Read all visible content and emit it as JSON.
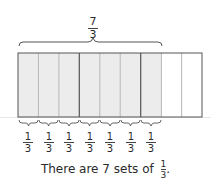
{
  "diagram": {
    "total_label": {
      "numerator": "7",
      "denominator": "3"
    },
    "bar": {
      "cell_count": 9,
      "shaded_cells": 7,
      "group_size": 3,
      "shaded_color": "#ececec",
      "unshaded_color": "#ffffff",
      "border_color": "#555555",
      "thin_divider_color": "#b8b8b8"
    },
    "unit_labels": [
      {
        "numerator": "1",
        "denominator": "3"
      },
      {
        "numerator": "1",
        "denominator": "3"
      },
      {
        "numerator": "1",
        "denominator": "3"
      },
      {
        "numerator": "1",
        "denominator": "3"
      },
      {
        "numerator": "1",
        "denominator": "3"
      },
      {
        "numerator": "1",
        "denominator": "3"
      },
      {
        "numerator": "1",
        "denominator": "3"
      }
    ]
  },
  "caption": {
    "text": "There are 7 sets of",
    "fraction": {
      "numerator": "1",
      "denominator": "3"
    },
    "end_punct": "."
  }
}
